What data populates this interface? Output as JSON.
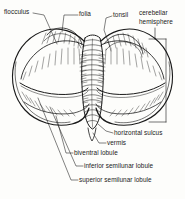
{
  "figure": {
    "style": "black-and-white line drawing",
    "background_color": "#fdfdfb",
    "ink_color": "#1a1a1a"
  },
  "labels": {
    "flocculus": "flocculus",
    "folia": "folia",
    "tonsil": "tonsil",
    "cerebellar_hemisphere_line1": "cerebellar",
    "cerebellar_hemisphere_line2": "hemisphere",
    "horizontal_sulcus": "horizontal sulcus",
    "vermis": "vermis",
    "biventral_lobule": "biventral lobule",
    "inferior_semilunar_lobule": "inferior semilunar lobule",
    "superior_semilunar_lobule": "superior semilunar lobule"
  }
}
